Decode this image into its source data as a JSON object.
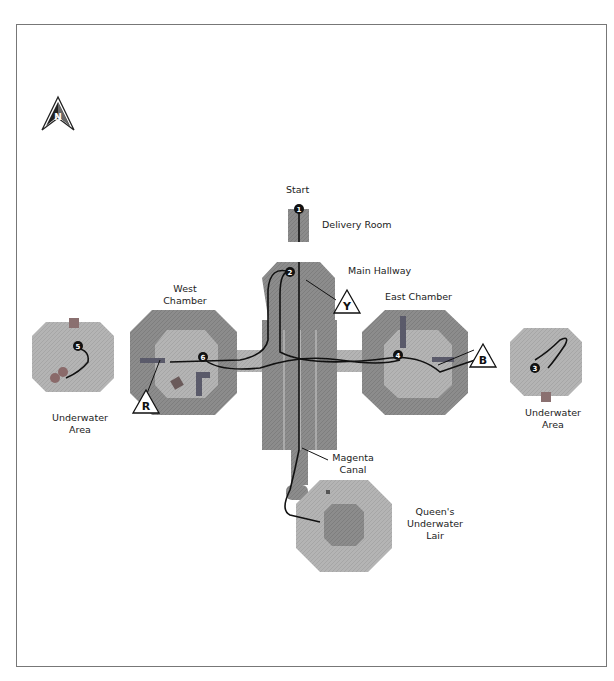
{
  "map": {
    "compass": {
      "letter": "N",
      "direction": "north"
    },
    "labels": {
      "start": "Start",
      "delivery_room": "Delivery Room",
      "main_hallway": "Main Hallway",
      "west_chamber": [
        "West",
        "Chamber"
      ],
      "east_chamber": "East Chamber",
      "underwater_area_west": [
        "Underwater",
        "Area"
      ],
      "underwater_area_east": [
        "Underwater",
        "Area"
      ],
      "magenta_canal": [
        "Magenta",
        "Canal"
      ],
      "queens_lair": [
        "Queen's",
        "Underwater",
        "Lair"
      ]
    },
    "waypoints": [
      "1",
      "2",
      "3",
      "4",
      "5",
      "6"
    ],
    "markers": [
      {
        "letter": "Y",
        "location": "Main Hallway"
      },
      {
        "letter": "B",
        "location": "East Chamber"
      },
      {
        "letter": "R",
        "location": "West Chamber"
      }
    ],
    "colors": {
      "room_dark": "#8a8a8a",
      "room_mid": "#a6a6a6",
      "room_light": "#c2c2c2",
      "path": "#111111",
      "frame": "#777777"
    }
  }
}
